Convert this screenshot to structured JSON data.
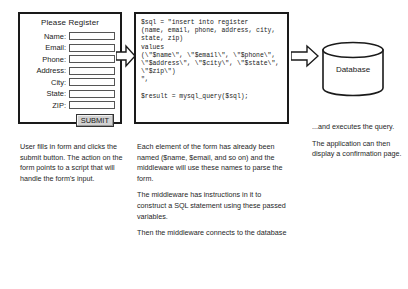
{
  "form": {
    "title": "Please Register",
    "fields": [
      {
        "label": "Name:",
        "value": ""
      },
      {
        "label": "Email:",
        "value": ""
      },
      {
        "label": "Phone:",
        "value": ""
      },
      {
        "label": "Address:",
        "value": ""
      },
      {
        "label": "City:",
        "value": ""
      },
      {
        "label": "State:",
        "value": ""
      },
      {
        "label": "ZIP:",
        "value": ""
      }
    ],
    "submit_label": "SUBMIT"
  },
  "code": {
    "text": "$sql = \"insert into register\n(name, email, phone, address, city,\nstate, zip)\nvalues\n(\\\"$name\\\", \\\"$email\\\", \\\"$phone\\\",\n\\\"$address\\\", \\\"$city\\\", \\\"$state\\\",\n\\\"$zip\\\")\n\",\n\n$result = mysql_query($sql);"
  },
  "database": {
    "label": "Database"
  },
  "captions": {
    "left": [
      "User fills in form and clicks the submit button. The action on the form points to a script that will handle the form's input."
    ],
    "middle": [
      "Each element of the form has already been named ($name, $email, and so on) and the middleware will use these names to parse the form.",
      "The middleware has instructions in it to construct a SQL statement using these passed variables.",
      "Then the middleware connects to the database"
    ],
    "right": [
      "...and executes the query.",
      "The application can then display a confirmation page."
    ]
  },
  "colors": {
    "stroke": "#1a1a1a",
    "button_face": "#d2d2d2",
    "background": "#ffffff"
  },
  "icons": {
    "arrow_left": "block-arrow-right-icon",
    "arrow_right": "block-arrow-right-icon",
    "database": "database-cylinder-icon"
  }
}
